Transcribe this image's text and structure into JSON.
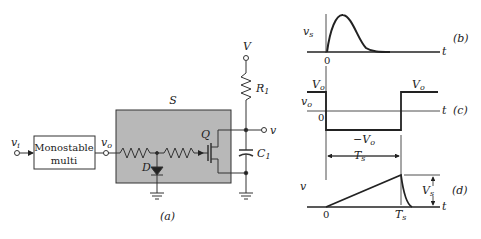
{
  "circuit": {
    "input_label": "v",
    "input_sub": "i",
    "block_line1": "Monostable",
    "block_line2": "multi",
    "vo_label": "v",
    "vo_sub": "o",
    "switch_label": "S",
    "diode_label": "D",
    "transistor_label": "Q",
    "supply_label": "V",
    "resistor_label": "R",
    "resistor_sub": "1",
    "capacitor_label": "C",
    "capacitor_sub": "1",
    "output_label": "v",
    "caption": "(a)",
    "switch_fill": "#b8b8b8"
  },
  "waveforms": {
    "b": {
      "ylabel": "v",
      "ylabel_sub": "s",
      "xlabel": "t",
      "origin": "0",
      "caption": "(b)"
    },
    "c": {
      "ylabel": "v",
      "ylabel_sub": "o",
      "xlabel": "t",
      "origin": "0",
      "high_left": "V",
      "high_left_sub": "o",
      "high_right": "V",
      "high_right_sub": "o",
      "low": "−V",
      "low_sub": "o",
      "caption": "(c)"
    },
    "d": {
      "ylabel": "v",
      "xlabel": "t",
      "origin": "0",
      "period": "T",
      "period_sub": "s",
      "tick": "T",
      "tick_sub": "s",
      "amp": "V",
      "amp_sub": "s",
      "caption": "(d)"
    }
  }
}
